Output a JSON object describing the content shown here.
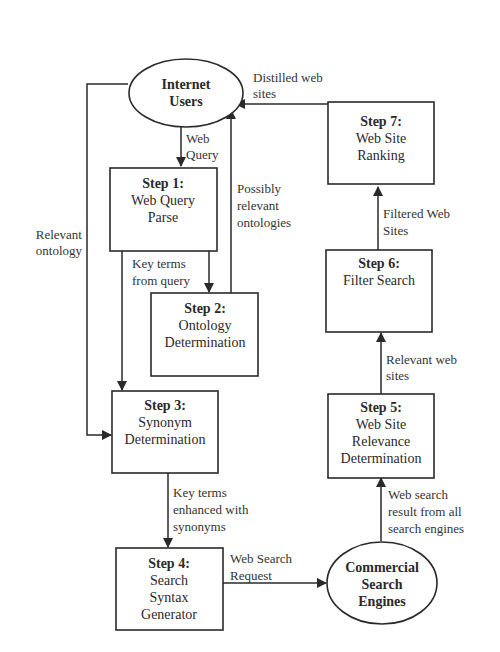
{
  "diagram": {
    "colors": {
      "stroke": "#2a2a2a",
      "background": "#ffffff",
      "text": "#2a2a2a"
    },
    "nodes": {
      "internet_users": {
        "type": "ellipse",
        "lines": [
          "Internet",
          "Users"
        ]
      },
      "step1": {
        "title": "Step 1:",
        "lines": [
          "Web Query",
          "Parse"
        ]
      },
      "step2": {
        "title": "Step 2:",
        "lines": [
          "Ontology",
          "Determination"
        ]
      },
      "step3": {
        "title": "Step 3:",
        "lines": [
          "Synonym",
          "Determination"
        ]
      },
      "step4": {
        "title": "Step 4:",
        "lines": [
          "Search",
          "Syntax",
          "Generator"
        ]
      },
      "commercial": {
        "type": "ellipse",
        "lines": [
          "Commercial",
          "Search",
          "Engines"
        ]
      },
      "step5": {
        "title": "Step 5:",
        "lines": [
          "Web Site",
          "Relevance",
          "Determination"
        ]
      },
      "step6": {
        "title": "Step 6:",
        "lines": [
          "Filter Search"
        ]
      },
      "step7": {
        "title": "Step 7:",
        "lines": [
          "Web Site",
          "Ranking"
        ]
      }
    },
    "edges": {
      "users_to_step1": {
        "from": "Internet Users",
        "to": "Step 1",
        "label": [
          "Web",
          "Query"
        ]
      },
      "step1_to_step2": {
        "from": "Step 1",
        "to": "Step 2",
        "label": [
          "Key terms",
          "from query"
        ]
      },
      "step2_to_users": {
        "from": "Step 2",
        "to": "Internet Users",
        "label": [
          "Possibly",
          "relevant",
          "ontologies"
        ]
      },
      "users_to_step3": {
        "from": "Internet Users",
        "to": "Step 3",
        "label": [
          "Relevant",
          "ontology"
        ]
      },
      "step1_to_step3": {
        "from": "Step 1",
        "to": "Step 3",
        "label": []
      },
      "step3_to_step4": {
        "from": "Step 3",
        "to": "Step 4",
        "label": [
          "Key terms",
          "enhanced with",
          "synonyms"
        ]
      },
      "step4_to_commercial": {
        "from": "Step 4",
        "to": "Commercial Search Engines",
        "label": [
          "Web Search",
          "Request"
        ]
      },
      "commercial_to_step5": {
        "from": "Commercial Search Engines",
        "to": "Step 5",
        "label": [
          "Web search",
          "result from all",
          "search engines"
        ]
      },
      "step5_to_step6": {
        "from": "Step 5",
        "to": "Step 6",
        "label": [
          "Relevant web",
          "sites"
        ]
      },
      "step6_to_step7": {
        "from": "Step 6",
        "to": "Step 7",
        "label": [
          "Filtered Web",
          "Sites"
        ]
      },
      "step7_to_users": {
        "from": "Step 7",
        "to": "Internet Users",
        "label": [
          "Distilled web",
          "sites"
        ]
      }
    }
  }
}
